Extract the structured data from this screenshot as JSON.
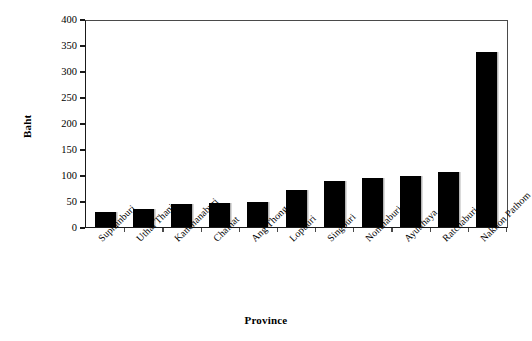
{
  "chart_data": {
    "type": "bar",
    "title": "",
    "xlabel": "Province",
    "ylabel": "Baht",
    "categories": [
      "Suphanburi",
      "Uthai Thani",
      "Kanchanaburi",
      "Chainat",
      "Ang Thong",
      "Lopburi",
      "Singburi",
      "Nonthaburi",
      "Ayutthaya",
      "Ratchaburi",
      "Nakhon Pathom"
    ],
    "values": [
      28,
      34,
      45,
      46,
      48,
      72,
      89,
      95,
      99,
      105,
      337
    ],
    "ylim": [
      0,
      400
    ],
    "yticks": [
      0,
      50,
      100,
      150,
      200,
      250,
      300,
      350,
      400
    ],
    "ytick_labels": [
      "0",
      "50",
      "100",
      "150",
      "200",
      "250",
      "300",
      "350",
      "400"
    ],
    "grid": false,
    "legend": null,
    "bar_color": "#000000",
    "axis_color": "#1a1a1a",
    "background_color": "#ffffff"
  }
}
